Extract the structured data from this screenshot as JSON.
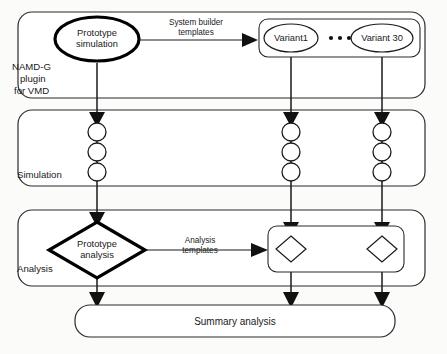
{
  "diagram": {
    "background_color": "#fbfbfa",
    "line_color": "#1a1a1a",
    "sections": [
      {
        "id": "namd-g",
        "label_lines": [
          "NAMD-G",
          "plugin",
          "for VMD"
        ],
        "label_l1": "NAMD-G",
        "label_l2": "plugin",
        "label_l3": "for VMD"
      },
      {
        "id": "simulation",
        "label": "Simulation"
      },
      {
        "id": "analysis",
        "label": "Analysis"
      }
    ],
    "nodes": {
      "prototype_simulation": {
        "label_l1": "Prototype",
        "label_l2": "simulation",
        "shape": "ellipse",
        "emphasis": "bold"
      },
      "prototype_analysis": {
        "label_l1": "Prototype",
        "label_l2": "analysis",
        "shape": "diamond",
        "emphasis": "bold"
      },
      "variant_first": {
        "label": "Variant1",
        "shape": "ellipse"
      },
      "variant_last": {
        "label": "Variant 30",
        "shape": "ellipse"
      },
      "variant_ellipsis": {
        "label": "• • •",
        "shape": "dots"
      },
      "summary_analysis": {
        "label": "Summary analysis",
        "shape": "rounded-rect"
      }
    },
    "edges": [
      {
        "id": "system-builder",
        "label_l1": "System builder",
        "label_l2": "templates",
        "from": "prototype_simulation",
        "to": "variants_group"
      },
      {
        "id": "analysis-templates",
        "label_l1": "Analysis",
        "label_l2": "templates",
        "from": "prototype_analysis",
        "to": "variant_analysis_group"
      }
    ],
    "simulation_steps_per_lane": 3,
    "lanes": 3
  }
}
